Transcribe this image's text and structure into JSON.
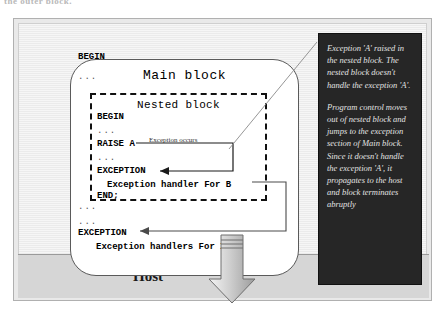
{
  "top_caption": "the outer block.",
  "frame": {
    "background_color": "#e9e9e9",
    "border_color": "#b0b0b0"
  },
  "host": {
    "label": "Host",
    "band_color": "#d6d6d6",
    "arrow_name": "propagation-down-arrow"
  },
  "main_block": {
    "title": "Main block",
    "lines": [
      "BEGIN",
      "...",
      "...",
      "EXCEPTION",
      "   Exception handlers For XX"
    ],
    "begin": "BEGIN",
    "dots_1": "...",
    "dots_2": "...",
    "dots_3": "...",
    "exception_keyword": "EXCEPTION",
    "handler_line": "Exception handlers For XX"
  },
  "nested_block": {
    "title": "Nested block",
    "begin": "BEGIN",
    "dots_1": "...",
    "raise_line": "RAISE A",
    "dots_2": "...",
    "exception_keyword": "EXCEPTION",
    "handler_line": "Exception handler For B",
    "end_line": "END;"
  },
  "annotations": {
    "exception_occurs": "Exception occurs"
  },
  "callout": {
    "background_color": "#262626",
    "text_color": "#e2e2e2",
    "paragraphs": [
      "Exception 'A' raised in the nested block. The nested block doesn't handle the exception 'A'.",
      "Program control moves out of nested block and jumps to the exception section of Main block. Since it doesn't handle the exception 'A', it propagates to the host and block terminates abruptly"
    ]
  }
}
